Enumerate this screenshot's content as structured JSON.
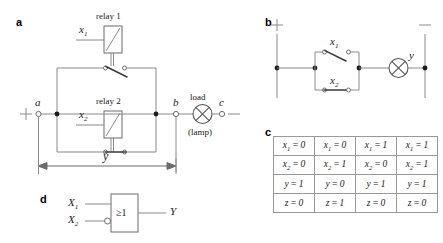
{
  "figure": {
    "panels": [
      {
        "id": "a",
        "letter": "a"
      },
      {
        "id": "b",
        "letter": "b"
      },
      {
        "id": "c",
        "letter": "c"
      },
      {
        "id": "d",
        "letter": "d"
      }
    ]
  },
  "panel_a": {
    "letter": "a",
    "relay1_label": "relay 1",
    "relay2_label": "relay 2",
    "x1_label": "x",
    "x1_sub": "1",
    "x2_label": "x",
    "x2_sub": "2",
    "terminal_a": "a",
    "terminal_b": "b",
    "terminal_c": "c",
    "plus_sign": "+",
    "minus_sign": "–",
    "load_label": "load",
    "lamp_label": "(lamp)",
    "y_label": "y"
  },
  "panel_b": {
    "letter": "b",
    "plus_sign": "+",
    "minus_sign": "–",
    "x1_label": "x",
    "x1_sub": "1",
    "x2_label": "x",
    "x2_sub": "2",
    "y_label": "y"
  },
  "panel_c": {
    "letter": "c",
    "rows": [
      {
        "var": "x",
        "sub": "1",
        "values": [
          "0",
          "0",
          "1",
          "1"
        ]
      },
      {
        "var": "x",
        "sub": "2",
        "values": [
          "0",
          "1",
          "0",
          "1"
        ]
      },
      {
        "var": "y",
        "sub": "",
        "values": [
          "1",
          "0",
          "1",
          "1"
        ]
      },
      {
        "var": "z",
        "sub": "",
        "values": [
          "0",
          "1",
          "0",
          "0"
        ]
      }
    ]
  },
  "panel_d": {
    "letter": "d",
    "input1_label": "X",
    "input1_sub": "1",
    "input2_label": "X",
    "input2_sub": "2",
    "gate_symbol": "≥1",
    "output_label": "Y"
  },
  "colors": {
    "wire": "#8a8a8a",
    "switch": "#3a3a3a",
    "text": "#1a1a1a",
    "border": "#9a9a9a",
    "background": "#ffffff"
  }
}
